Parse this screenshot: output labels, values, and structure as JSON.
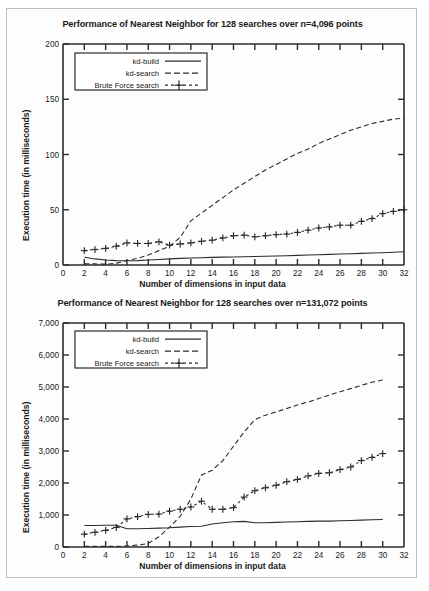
{
  "figure": {
    "background_color": "#ffffff",
    "frame_border_color": "#b9bcc0",
    "line_color": "#2b2b2b"
  },
  "charts": [
    {
      "id": "chart-top",
      "title": "Performance of Nearest Neighbor for 128 searches over n=4,096 points",
      "xlabel": "Number of dimensions in input data",
      "ylabel": "Execution time (in milliseconds)",
      "xticks": [
        "0",
        "2",
        "4",
        "6",
        "8",
        "10",
        "12",
        "14",
        "16",
        "18",
        "20",
        "22",
        "24",
        "26",
        "28",
        "30",
        "32"
      ],
      "yticks": [
        "0",
        "50",
        "100",
        "150",
        "200"
      ],
      "legend": [
        {
          "label": "kd-build",
          "style": "solid"
        },
        {
          "label": "kd-search",
          "style": "dashed"
        },
        {
          "label": "Brute Force search",
          "style": "dash-plus"
        }
      ]
    },
    {
      "id": "chart-bottom",
      "title": "Performance of Nearest Neighbor for 128 searches over n=131,072 points",
      "xlabel": "Number of dimensions in input data",
      "ylabel": "Execution time (in milliseconds)",
      "xticks": [
        "0",
        "2",
        "4",
        "6",
        "8",
        "10",
        "12",
        "14",
        "16",
        "18",
        "20",
        "22",
        "24",
        "26",
        "28",
        "30",
        "32"
      ],
      "yticks": [
        "0",
        "1,000",
        "2,000",
        "3,000",
        "4,000",
        "5,000",
        "6,000",
        "7,000"
      ],
      "legend": [
        {
          "label": "kd-build",
          "style": "solid"
        },
        {
          "label": "kd-search",
          "style": "dashed"
        },
        {
          "label": "Brute Force search",
          "style": "dash-plus"
        }
      ]
    }
  ],
  "caption": "",
  "chart_data": [
    {
      "type": "line",
      "title": "Performance of Nearest Neighbor for 128 searches over n=4,096 points",
      "xlabel": "Number of dimensions in input data",
      "ylabel": "Execution time (in milliseconds)",
      "xlim": [
        0,
        32
      ],
      "ylim": [
        0,
        200
      ],
      "xticks": [
        0,
        2,
        4,
        6,
        8,
        10,
        12,
        14,
        16,
        18,
        20,
        22,
        24,
        26,
        28,
        30,
        32
      ],
      "yticks": [
        0,
        50,
        100,
        150,
        200
      ],
      "grid": false,
      "legend_position": "top-left",
      "x": [
        2,
        3,
        4,
        5,
        6,
        7,
        8,
        9,
        10,
        11,
        12,
        13,
        14,
        15,
        16,
        17,
        18,
        19,
        20,
        21,
        22,
        23,
        24,
        25,
        26,
        27,
        28,
        29,
        30,
        31,
        32
      ],
      "series": [
        {
          "name": "kd-build",
          "style": "solid",
          "values": [
            7,
            5.5,
            4.5,
            4,
            3.8,
            4,
            4.5,
            5,
            5.5,
            6,
            6.3,
            6.6,
            6.9,
            7.1,
            7.3,
            7.5,
            7.7,
            7.9,
            8.1,
            8.4,
            8.7,
            9,
            9.3,
            9.6,
            9.9,
            10.2,
            10.5,
            10.8,
            11.1,
            11.5,
            12
          ]
        },
        {
          "name": "kd-search",
          "style": "dashed",
          "values": [
            1,
            1,
            0.8,
            1.5,
            4,
            6,
            9,
            13,
            17,
            25,
            40,
            47,
            54,
            61,
            68,
            74,
            80,
            86,
            91,
            96,
            101,
            105,
            110,
            114,
            118,
            122,
            125,
            128,
            130,
            132,
            133
          ]
        },
        {
          "name": "Brute Force search",
          "style": "dash-plus",
          "values": [
            13,
            14,
            15,
            17,
            20,
            19.5,
            19.5,
            21,
            18,
            19,
            20,
            21.5,
            22.5,
            24.5,
            26.5,
            27,
            25.5,
            26.5,
            27.5,
            28,
            29.5,
            31.5,
            33.5,
            34.5,
            36,
            36,
            39.5,
            42,
            46.5,
            48.5,
            50,
            52,
            53.5,
            57
          ]
        }
      ]
    },
    {
      "type": "line",
      "title": "Performance of Nearest Neighbor for 128 searches over n=131,072 points",
      "xlabel": "Number of dimensions in input data",
      "ylabel": "Execution time (in milliseconds)",
      "xlim": [
        0,
        32
      ],
      "ylim": [
        0,
        7000
      ],
      "xticks": [
        0,
        2,
        4,
        6,
        8,
        10,
        12,
        14,
        16,
        18,
        20,
        22,
        24,
        26,
        28,
        30,
        32
      ],
      "yticks": [
        0,
        1000,
        2000,
        3000,
        4000,
        5000,
        6000,
        7000
      ],
      "grid": false,
      "legend_position": "top-left",
      "x": [
        2,
        3,
        4,
        5,
        6,
        7,
        8,
        9,
        10,
        11,
        12,
        13,
        14,
        15,
        16,
        17,
        18,
        19,
        20,
        21,
        22,
        23,
        24,
        25,
        26,
        27,
        28,
        29,
        30
      ],
      "series": [
        {
          "name": "kd-build",
          "style": "solid",
          "values": [
            670,
            670,
            680,
            680,
            570,
            570,
            580,
            590,
            600,
            620,
            640,
            650,
            720,
            760,
            790,
            800,
            760,
            760,
            770,
            780,
            790,
            800,
            810,
            810,
            820,
            830,
            840,
            850,
            860
          ]
        },
        {
          "name": "kd-search",
          "style": "dashed",
          "values": [
            20,
            20,
            20,
            20,
            30,
            60,
            110,
            320,
            620,
            960,
            1500,
            2250,
            2400,
            2700,
            3150,
            3600,
            3980,
            4120,
            4220,
            4330,
            4440,
            4530,
            4640,
            4750,
            4850,
            4950,
            5050,
            5150,
            5220
          ]
        },
        {
          "name": "Brute Force search",
          "style": "dash-plus",
          "values": [
            400,
            460,
            520,
            610,
            880,
            950,
            1020,
            1030,
            1120,
            1180,
            1250,
            1430,
            1180,
            1180,
            1230,
            1560,
            1760,
            1850,
            1930,
            2040,
            2110,
            2220,
            2300,
            2320,
            2420,
            2500,
            2700,
            2800,
            2920
          ]
        }
      ]
    }
  ]
}
